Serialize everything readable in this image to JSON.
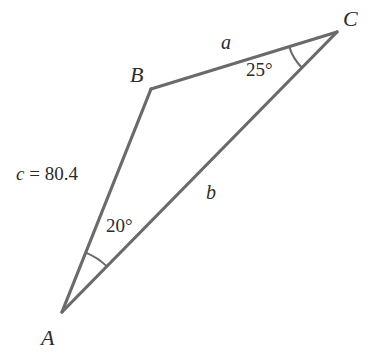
{
  "figure": {
    "kind": "triangle-diagram",
    "background_color": "#ffffff",
    "stroke_color": "#6a6a6a",
    "text_color": "#2b2b2b",
    "stroke_width": 3.2
  },
  "vertices": [
    {
      "name": "A",
      "label": "A",
      "x": 62,
      "y": 312,
      "label_x": 41,
      "label_y": 327
    },
    {
      "name": "B",
      "label": "B",
      "x": 151,
      "y": 89,
      "label_x": 130,
      "label_y": 64
    },
    {
      "name": "C",
      "label": "C",
      "x": 337,
      "y": 32,
      "label_x": 343,
      "label_y": 8
    }
  ],
  "sides": [
    {
      "name": "a",
      "label": "a",
      "between": "B-C",
      "label_x": 221,
      "label_y": 32
    },
    {
      "name": "b",
      "label": "b",
      "between": "A-C",
      "label_x": 206,
      "label_y": 182
    },
    {
      "name": "c",
      "label": "c = 80.4",
      "symbol": "c",
      "equals": " = ",
      "value": "80.4",
      "between": "A-B",
      "label_x": 16,
      "label_y": 164
    }
  ],
  "angles": [
    {
      "at": "A",
      "label": "20°",
      "value": 20,
      "unit": "degrees",
      "label_x": 106,
      "label_y": 216,
      "arc_radius": 64
    },
    {
      "at": "C",
      "label": "25°",
      "value": 25,
      "unit": "degrees",
      "label_x": 246,
      "label_y": 60,
      "arc_radius": 50
    }
  ],
  "chart_data": {
    "type": "diagram",
    "title": "",
    "points": {
      "A": [
        62,
        312
      ],
      "B": [
        151,
        89
      ],
      "C": [
        337,
        32
      ]
    },
    "known": {
      "angle_A": "20°",
      "angle_C": "25°",
      "side_c": "80.4"
    },
    "unknown": [
      "a",
      "b"
    ]
  }
}
